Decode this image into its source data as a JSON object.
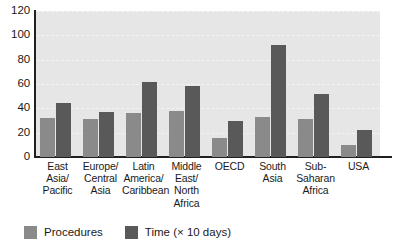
{
  "chart_data": {
    "type": "bar",
    "title": "",
    "subtitle": "",
    "xlabel": "",
    "ylabel": "",
    "ylim": [
      0,
      120
    ],
    "yticks": [
      0,
      20,
      40,
      60,
      80,
      100,
      120
    ],
    "ytick_labels": [
      "0",
      "20",
      "40",
      "60",
      "80",
      "100",
      "120"
    ],
    "grid": true,
    "grid_axis": "y",
    "legend_position": "bottom-left",
    "orientation": "vertical",
    "categories": [
      "East Asia/ Pacific",
      "Europe/ Central Asia",
      "Latin America/ Caribbean",
      "Middle East/ North Africa",
      "OECD",
      "South Asia",
      "Sub- Saharan Africa",
      "USA"
    ],
    "category_lines": [
      [
        "East Asia/",
        "Pacific"
      ],
      [
        "Europe/",
        "Central",
        "Asia"
      ],
      [
        "Latin",
        "America/",
        "Caribbean"
      ],
      [
        "Middle",
        "East/",
        "North",
        "Africa"
      ],
      [
        "OECD"
      ],
      [
        "South",
        "Asia"
      ],
      [
        "Sub-",
        "Saharan",
        "Africa"
      ],
      [
        "USA"
      ]
    ],
    "series": [
      {
        "name": "Procedures",
        "color": "#8a8a8a",
        "values": [
          32,
          31,
          36,
          38,
          16,
          33,
          31,
          10
        ]
      },
      {
        "name": "Time (× 10 days)",
        "color": "#595959",
        "values": [
          44,
          37,
          62,
          58,
          30,
          92,
          52,
          22
        ]
      }
    ]
  },
  "legend": {
    "items": [
      {
        "label": "Procedures",
        "color": "#8a8a8a"
      },
      {
        "label": "Time (× 10 days)",
        "color": "#595959"
      }
    ]
  },
  "colors": {
    "plot_background": "#e6e6e6",
    "page_background": "#ffffff",
    "axis": "#231f20",
    "gridline": "#f4f4f4",
    "series_procedures": "#8a8a8a",
    "series_time": "#595959",
    "text": "#1a1a1a"
  }
}
